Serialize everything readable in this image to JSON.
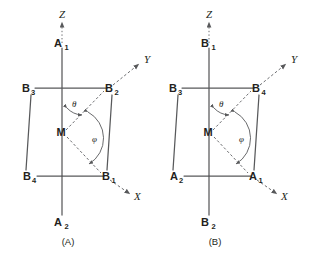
{
  "figure": {
    "background_color": "#ffffff",
    "line_color": "#58595b",
    "text_color": "#231f20"
  },
  "panels": [
    {
      "id": "A",
      "caption": "(A)",
      "axes": [
        {
          "name": "z-axis",
          "label": "Z"
        },
        {
          "name": "y-axis",
          "label": "Y"
        },
        {
          "name": "x-axis",
          "label": "X"
        }
      ],
      "center_atom": {
        "label": "M"
      },
      "angles": [
        {
          "name": "theta",
          "label": "θ"
        },
        {
          "name": "phi",
          "label": "φ"
        }
      ],
      "vertices": [
        {
          "name": "a1",
          "base": "A",
          "sub": "1",
          "position": "top-on-z-axis"
        },
        {
          "name": "a2",
          "base": "A",
          "sub": "2",
          "position": "bottom-below-center"
        },
        {
          "name": "b1",
          "base": "B",
          "sub": "1",
          "position": "lower-right-on-x-axis"
        },
        {
          "name": "b2",
          "base": "B",
          "sub": "2",
          "position": "upper-right-on-y-axis"
        },
        {
          "name": "b3",
          "base": "B",
          "sub": "3",
          "position": "upper-left"
        },
        {
          "name": "b4",
          "base": "B",
          "sub": "4",
          "position": "lower-left"
        }
      ]
    },
    {
      "id": "B",
      "caption": "(B)",
      "axes": [
        {
          "name": "z-axis",
          "label": "Z"
        },
        {
          "name": "y-axis",
          "label": "Y"
        },
        {
          "name": "x-axis",
          "label": "X"
        }
      ],
      "center_atom": {
        "label": "M"
      },
      "angles": [
        {
          "name": "theta",
          "label": "θ"
        },
        {
          "name": "phi",
          "label": "φ"
        }
      ],
      "vertices": [
        {
          "name": "b1",
          "base": "B",
          "sub": "1",
          "position": "top-on-z-axis"
        },
        {
          "name": "b2",
          "base": "B",
          "sub": "2",
          "position": "bottom-below-center"
        },
        {
          "name": "a1",
          "base": "A",
          "sub": "1",
          "position": "lower-right-on-x-axis"
        },
        {
          "name": "a2",
          "base": "A",
          "sub": "2",
          "position": "upper-right-on-y-axis"
        },
        {
          "name": "b3",
          "base": "B",
          "sub": "3",
          "position": "upper-left"
        },
        {
          "name": "b4",
          "base": "B",
          "sub": "4",
          "position": "lower-left"
        }
      ]
    }
  ]
}
